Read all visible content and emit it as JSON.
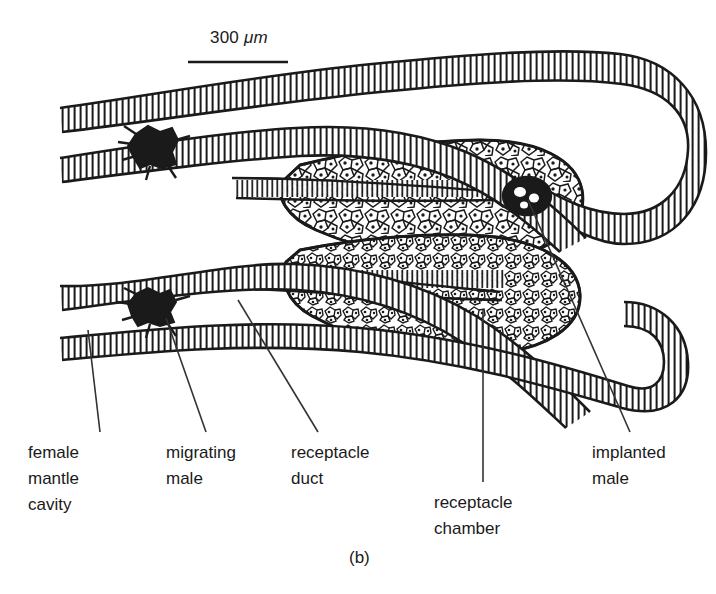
{
  "figure": {
    "caption": "(b)",
    "background_color": "#ffffff",
    "ink_color": "#1a1a1a"
  },
  "scale_bar": {
    "value": "300",
    "unit": "μm",
    "label": "300 μm",
    "x_start": 188,
    "x_end": 288,
    "y": 62
  },
  "labels": [
    {
      "id": "female-mantle-cavity",
      "lines": [
        "female",
        "mantle",
        "cavity"
      ],
      "x": 28,
      "y": 440,
      "leader": {
        "x1": 100,
        "y1": 432,
        "x2": 88,
        "y2": 330
      }
    },
    {
      "id": "migrating-male",
      "lines": [
        "migrating",
        "male"
      ],
      "x": 166,
      "y": 440,
      "leader": {
        "x1": 206,
        "y1": 432,
        "x2": 166,
        "y2": 318
      }
    },
    {
      "id": "receptacle-duct",
      "lines": [
        "receptacle",
        "duct"
      ],
      "x": 291,
      "y": 440,
      "leader": {
        "x1": 318,
        "y1": 432,
        "x2": 238,
        "y2": 300
      }
    },
    {
      "id": "receptacle-chamber",
      "lines": [
        "receptacle",
        "chamber"
      ],
      "x": 434,
      "y": 490,
      "leader": {
        "x1": 483,
        "y1": 482,
        "x2": 483,
        "y2": 310
      }
    },
    {
      "id": "implanted-male",
      "lines": [
        "implanted",
        "male"
      ],
      "x": 592,
      "y": 440,
      "leader": {
        "x1": 630,
        "y1": 432,
        "x2": 528,
        "y2": 200
      }
    }
  ],
  "structures": [
    {
      "id": "upper-outer-mantle-wall",
      "kind": "ciliated-epithelium-band"
    },
    {
      "id": "upper-inner-mantle-wall",
      "kind": "ciliated-epithelium-band"
    },
    {
      "id": "lower-inner-mantle-wall",
      "kind": "ciliated-epithelium-band"
    },
    {
      "id": "lower-outer-mantle-wall",
      "kind": "ciliated-epithelium-band"
    },
    {
      "id": "upper-receptacle-chamber",
      "kind": "cellular-tissue-mass"
    },
    {
      "id": "lower-receptacle-chamber",
      "kind": "cellular-tissue-mass"
    },
    {
      "id": "upper-receptacle-duct",
      "kind": "duct-lumen"
    },
    {
      "id": "lower-receptacle-duct",
      "kind": "duct-lumen"
    },
    {
      "id": "migrating-male-upper",
      "kind": "dwarf-male-body",
      "cx": 157,
      "cy": 146
    },
    {
      "id": "migrating-male-lower",
      "kind": "dwarf-male-body",
      "cx": 155,
      "cy": 305
    },
    {
      "id": "implanted-male-body",
      "kind": "dwarf-male-body",
      "cx": 527,
      "cy": 196
    }
  ]
}
